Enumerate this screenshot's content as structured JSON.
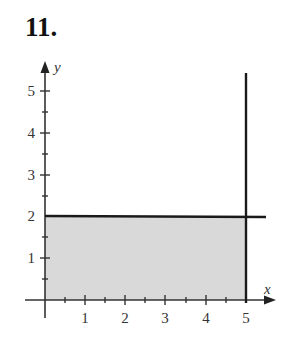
{
  "problem": {
    "number": "11."
  },
  "axes": {
    "x_label": "x",
    "y_label": "y",
    "x_ticks": [
      "1",
      "2",
      "3",
      "4",
      "5"
    ],
    "y_ticks": [
      "1",
      "2",
      "3",
      "4",
      "5"
    ]
  },
  "region": {
    "description": "Shaded rectangle 0 ≤ x ≤ 5, 0 ≤ y ≤ 2",
    "fill_color": "#d9d9d9",
    "boundary_lines": [
      "y = 2",
      "x = 5"
    ]
  },
  "colors": {
    "line": "#1a1a1a",
    "axis": "#333333"
  }
}
